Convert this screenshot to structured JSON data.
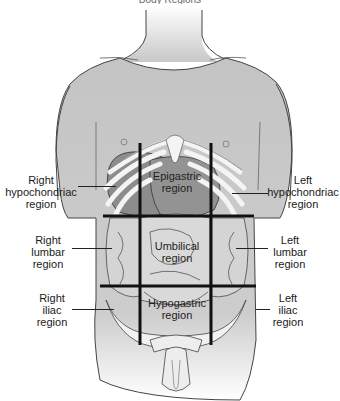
{
  "title_fragment": "Body Regions",
  "colors": {
    "background": "#ffffff",
    "skin": "#cfcfcf",
    "skin_shadow": "#b8b8b8",
    "organ": "#8c8c8c",
    "bone": "#f2f2f2",
    "intestine": "#d6d6d6",
    "grid_line": "#111111",
    "outline": "#333333"
  },
  "regions": {
    "right_hypochondriac": "Right\nhypochondriac\nregion",
    "epigastric": "Epigastric\nregion",
    "left_hypochondriac": "Left\nhypochondriac\nregion",
    "right_lumbar": "Right\nlumbar\nregion",
    "umbilical": "Umbilical\nregion",
    "left_lumbar": "Left\nlumbar\nregion",
    "right_iliac": "Right\niliac\nregion",
    "hypogastric": "Hypogastric\nregion",
    "left_iliac": "Left\niliac\nregion"
  }
}
